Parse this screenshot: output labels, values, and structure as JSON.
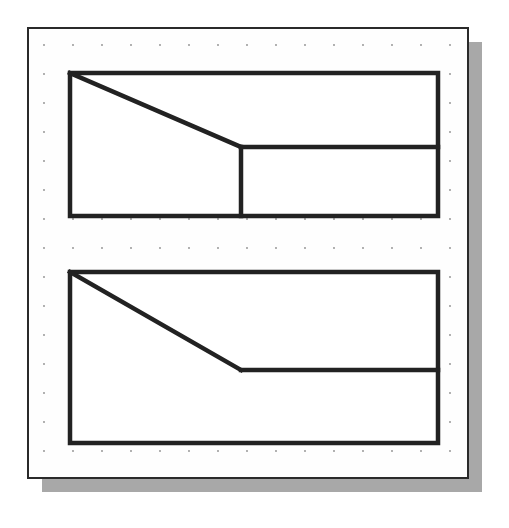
{
  "canvas": {
    "background_color": "#fefefe",
    "border_color": "#2a2a2a",
    "border_width": 2,
    "shadow_color": "#a8a8a8",
    "shadow_offset_x": 14,
    "shadow_offset_y": 14,
    "x": 28,
    "y": 28,
    "width": 440,
    "height": 450
  },
  "grid": {
    "dot_color": "#8d8d8d",
    "dot_radius": 0.9,
    "spacing_x": 29,
    "spacing_y": 29,
    "origin_x": 44,
    "origin_y": 45,
    "columns": 15,
    "rows": 15,
    "visible": true
  },
  "drawing": {
    "line_color": "#222222",
    "line_width": 4.5,
    "fill_color": "#ffffff",
    "shapes": [
      {
        "name": "top-figure",
        "label": "Top chamfered rectangle with horizontal divider",
        "outline": [
          [
            70,
            73
          ],
          [
            438,
            73
          ],
          [
            438,
            216
          ],
          [
            70,
            216
          ]
        ],
        "diagonal": [
          [
            70,
            73
          ],
          [
            241,
            147
          ]
        ],
        "vertical_divider": [
          [
            241,
            147
          ],
          [
            241,
            216
          ]
        ],
        "horizontal_divider": [
          [
            241,
            147
          ],
          [
            438,
            147
          ]
        ]
      },
      {
        "name": "bottom-figure",
        "label": "Bottom chamfered rectangle with elbow line",
        "outline": [
          [
            70,
            272
          ],
          [
            438,
            272
          ],
          [
            438,
            443
          ],
          [
            70,
            443
          ]
        ],
        "diagonal": [
          [
            70,
            272
          ],
          [
            241,
            370
          ]
        ],
        "horizontal_divider": [
          [
            241,
            370
          ],
          [
            438,
            370
          ]
        ]
      }
    ]
  }
}
